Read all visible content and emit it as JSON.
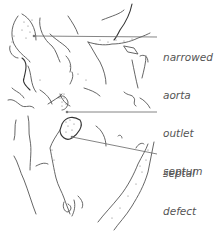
{
  "diagram": {
    "labels": [
      {
        "id": "narrowed-aorta",
        "lines": [
          "narrowed",
          "aorta"
        ],
        "x": 163,
        "y": 27
      },
      {
        "id": "outlet-septum",
        "lines": [
          "outlet",
          "septum"
        ],
        "x": 163,
        "y": 103
      },
      {
        "id": "septal-defect",
        "lines": [
          "septal",
          "defect"
        ],
        "x": 163,
        "y": 143
      }
    ],
    "leaders": [
      {
        "id": "narrowed-aorta",
        "x1": 34,
        "y1": 36,
        "x2": 157,
        "y2": 37
      },
      {
        "id": "outlet-septum",
        "x1": 67,
        "y1": 112,
        "x2": 157,
        "y2": 112
      },
      {
        "id": "septal-defect",
        "x1": 72,
        "y1": 137,
        "x2": 157,
        "y2": 154
      }
    ],
    "colors": {
      "line": "#555555",
      "text": "#555555",
      "background": "#ffffff"
    }
  }
}
